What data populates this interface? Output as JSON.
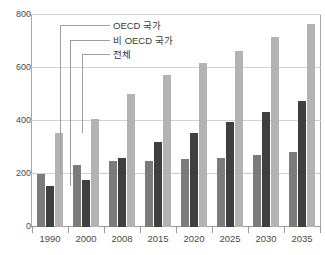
{
  "chart_data": {
    "type": "bar",
    "title": "",
    "subtitle": "",
    "xlabel": "",
    "ylabel": "",
    "categories": [
      "1990",
      "2000",
      "2008",
      "2015",
      "2020",
      "2025",
      "2030",
      "2035"
    ],
    "series": [
      {
        "name": "OECD 국가",
        "color": "#7b7b7b",
        "values": [
          200,
          233,
          248,
          250,
          258,
          262,
          270,
          283
        ]
      },
      {
        "name": "비 OECD 국가",
        "color": "#3f3f3f",
        "values": [
          155,
          178,
          260,
          322,
          355,
          398,
          433,
          475
        ]
      },
      {
        "name": "전체",
        "color": "#b3b3b3",
        "values": [
          355,
          408,
          503,
          573,
          618,
          665,
          718,
          765
        ]
      }
    ],
    "ylim": [
      0,
      800
    ],
    "yticks": [
      "800",
      "600",
      "400",
      "200",
      "0"
    ],
    "ytick_values": [
      800,
      600,
      400,
      200,
      0
    ],
    "grid": true,
    "legend_position": "inside-top-left-with-leader-lines"
  },
  "legend": {
    "items": [
      {
        "label": "OECD 국가"
      },
      {
        "label": "비 OECD 국가"
      },
      {
        "label": "전체"
      }
    ]
  }
}
